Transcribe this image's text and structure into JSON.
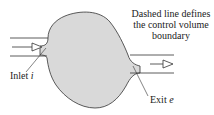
{
  "diagram": {
    "caption_lines": [
      "Dashed line defines",
      "the control volume",
      "boundary"
    ],
    "inlet_label": "Inlet",
    "inlet_symbol": "i",
    "exit_label": "Exit",
    "exit_symbol": "e",
    "colors": {
      "fill": "#d9d9d9",
      "stroke": "#333333"
    }
  }
}
